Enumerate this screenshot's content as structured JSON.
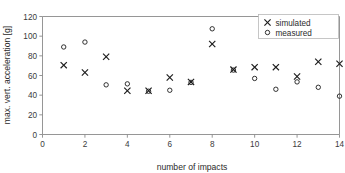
{
  "chart_data": {
    "type": "scatter",
    "title": "",
    "xlabel": "number of impacts",
    "ylabel": "max. vert. acceleration [g]",
    "xlim": [
      0,
      14
    ],
    "ylim": [
      0,
      120
    ],
    "xticks": [
      0,
      2,
      4,
      6,
      8,
      10,
      12,
      14
    ],
    "yticks": [
      0,
      20,
      40,
      60,
      80,
      100,
      120
    ],
    "grid": false,
    "legend_position": "top-right",
    "x": [
      1,
      2,
      3,
      4,
      5,
      6,
      7,
      8,
      9,
      10,
      11,
      12,
      13,
      14
    ],
    "series": [
      {
        "name": "simulated",
        "marker": "x",
        "color": "#1c1c1c",
        "values": [
          70.5,
          63,
          79,
          44.5,
          44.5,
          58,
          53.5,
          92,
          66,
          68.5,
          68.5,
          59,
          74,
          72
        ]
      },
      {
        "name": "measured",
        "marker": "o",
        "color": "#1c1c1c",
        "values": [
          89,
          94,
          50.5,
          51.5,
          44,
          45,
          53,
          107.5,
          65.5,
          57,
          46,
          53.5,
          48,
          39
        ]
      }
    ]
  },
  "legend": {
    "entries": [
      {
        "label": "simulated",
        "marker": "x"
      },
      {
        "label": "measured",
        "marker": "o"
      }
    ]
  }
}
